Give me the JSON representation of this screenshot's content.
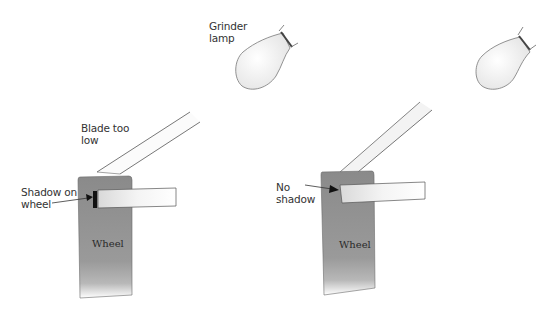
{
  "labels": {
    "grinder_lamp_1": "Grinder",
    "grinder_lamp_2": "lamp",
    "blade_too_low_1": "Blade too",
    "blade_too_low_2": "low",
    "shadow_on_wheel_1": "Shadow on",
    "shadow_on_wheel_2": "wheel",
    "no_shadow_1": "No",
    "no_shadow_2": "shadow",
    "wheel_left": "Wheel",
    "wheel_right": "Wheel"
  },
  "colors": {
    "wheel_fill": "#8f8f8f",
    "wheel_edge": "#6a6a6a",
    "tool_rest_fill": "#f2f2f2",
    "line": "#555555",
    "shadow": "#111111"
  },
  "panels": [
    {
      "name": "blade-too-low",
      "shadow_visible": true
    },
    {
      "name": "no-shadow",
      "shadow_visible": false
    }
  ]
}
